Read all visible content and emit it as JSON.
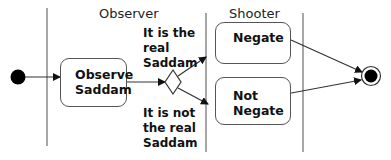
{
  "diagram": {
    "type": "uml-activity-diagram",
    "swimlanes": [
      {
        "id": "observer",
        "title": "Observer"
      },
      {
        "id": "shooter",
        "title": "Shooter"
      }
    ],
    "actions": {
      "observe": {
        "label": "Observe\nSaddam"
      },
      "negate": {
        "label": "Negate"
      },
      "not_negate": {
        "label": "Not\nNegate"
      }
    },
    "guards": {
      "real": "It is the\nreal\nSaddam",
      "not_real": "It is not\nthe real\nSaddam"
    },
    "nodes": {
      "initial": "initial-node",
      "decision": "decision-node",
      "final": "final-node"
    },
    "colors": {
      "line": "#444444",
      "lane_line": "#666666",
      "fill": "#000000"
    }
  }
}
